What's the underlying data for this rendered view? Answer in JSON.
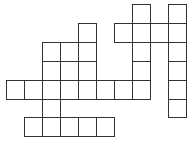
{
  "puzzle": {
    "type": "crossword",
    "origin": {
      "x": 6,
      "y": 4
    },
    "cell_w": 18,
    "cell_h": 18.9,
    "cols": 10,
    "rows": 7,
    "border_color": "#333333",
    "cells": [
      [
        0,
        7
      ],
      [
        0,
        9
      ],
      [
        1,
        4
      ],
      [
        1,
        6
      ],
      [
        1,
        7
      ],
      [
        1,
        8
      ],
      [
        1,
        9
      ],
      [
        2,
        2
      ],
      [
        2,
        3
      ],
      [
        2,
        4
      ],
      [
        2,
        7
      ],
      [
        2,
        9
      ],
      [
        3,
        2
      ],
      [
        3,
        3
      ],
      [
        3,
        4
      ],
      [
        3,
        7
      ],
      [
        3,
        9
      ],
      [
        4,
        0
      ],
      [
        4,
        1
      ],
      [
        4,
        2
      ],
      [
        4,
        3
      ],
      [
        4,
        4
      ],
      [
        4,
        5
      ],
      [
        4,
        6
      ],
      [
        4,
        7
      ],
      [
        4,
        9
      ],
      [
        5,
        2
      ],
      [
        5,
        9
      ],
      [
        6,
        1
      ],
      [
        6,
        2
      ],
      [
        6,
        3
      ],
      [
        6,
        4
      ],
      [
        6,
        5
      ]
    ]
  }
}
